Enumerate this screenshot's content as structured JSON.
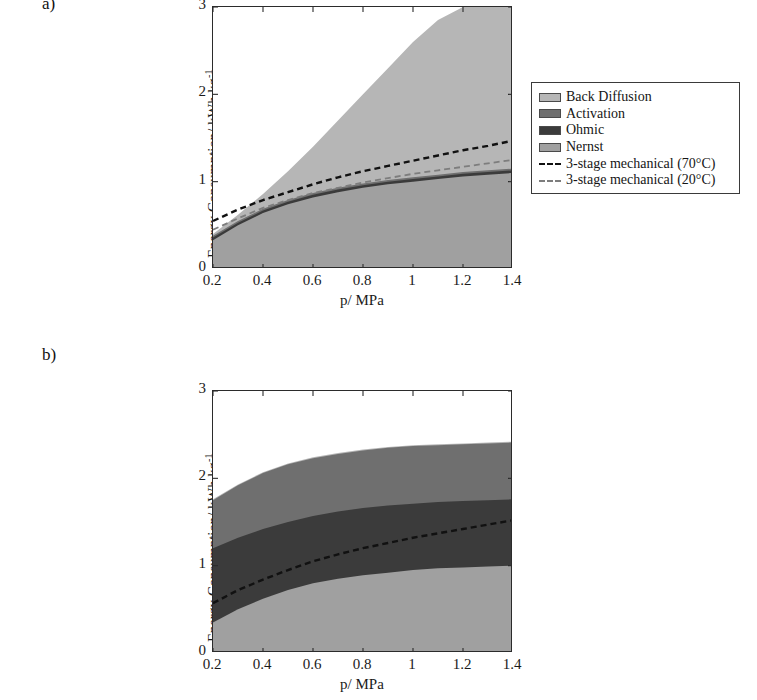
{
  "figure": {
    "panel_a_label": "a)",
    "panel_b_label": "b)"
  },
  "legend": {
    "items": [
      {
        "label": "Back Diffusion",
        "type": "swatch",
        "color": "#b6b6b6"
      },
      {
        "label": "Activation",
        "type": "swatch",
        "color": "#6f6f6f"
      },
      {
        "label": "Ohmic",
        "type": "swatch",
        "color": "#3b3b3b"
      },
      {
        "label": "Nernst",
        "type": "swatch",
        "color": "#a0a0a0"
      },
      {
        "label": "3-stage mechanical (70°C)",
        "type": "dash",
        "color": "#111111"
      },
      {
        "label": "3-stage mechanical (20°C)",
        "type": "dash",
        "color": "#7d7d7d"
      }
    ]
  },
  "chart_data": [
    {
      "id": "panel-a",
      "type": "area",
      "title": "",
      "xlabel": "p/ MPa",
      "ylabel": "Energy Consumption/ kWh kg⁻¹",
      "ylabel_main": "Energy Consumption/ kWh kg",
      "ylabel_sup": "-1",
      "xlim": [
        0.2,
        1.4
      ],
      "ylim": [
        0,
        3
      ],
      "xticks": [
        0.2,
        0.4,
        0.6,
        0.8,
        1,
        1.2,
        1.4
      ],
      "xticklabels": [
        "0.2",
        "0.4",
        "0.6",
        "0.8",
        "1",
        "1.2",
        "1.4"
      ],
      "yticks": [
        0,
        1,
        2,
        3
      ],
      "yticklabels": [
        "0",
        "1",
        "2",
        "3"
      ],
      "grid": false,
      "legend_position": "outside-right",
      "x": [
        0.2,
        0.3,
        0.4,
        0.5,
        0.6,
        0.7,
        0.8,
        0.9,
        1.0,
        1.1,
        1.2,
        1.3,
        1.4
      ],
      "series": [
        {
          "name": "Nernst",
          "color": "#a0a0a0",
          "stack_top": [
            0.33,
            0.5,
            0.64,
            0.74,
            0.82,
            0.88,
            0.93,
            0.97,
            1.0,
            1.03,
            1.06,
            1.08,
            1.1
          ]
        },
        {
          "name": "Ohmic",
          "color": "#3b3b3b",
          "stack_top": [
            0.36,
            0.53,
            0.67,
            0.77,
            0.85,
            0.91,
            0.96,
            1.0,
            1.03,
            1.06,
            1.09,
            1.11,
            1.13
          ]
        },
        {
          "name": "Activation",
          "color": "#6f6f6f",
          "stack_top": [
            0.38,
            0.55,
            0.69,
            0.79,
            0.87,
            0.93,
            0.98,
            1.02,
            1.05,
            1.08,
            1.11,
            1.13,
            1.15
          ]
        },
        {
          "name": "Back Diffusion",
          "color": "#b6b6b6",
          "stack_top": [
            0.4,
            0.62,
            0.86,
            1.12,
            1.4,
            1.7,
            2.0,
            2.3,
            2.6,
            2.85,
            3.0,
            3.0,
            3.0
          ]
        }
      ],
      "lines": [
        {
          "name": "3-stage mechanical (70°C)",
          "color": "#111111",
          "style": "dashed",
          "values": [
            0.55,
            0.68,
            0.79,
            0.88,
            0.97,
            1.05,
            1.12,
            1.18,
            1.24,
            1.3,
            1.36,
            1.41,
            1.47
          ]
        },
        {
          "name": "3-stage mechanical (20°C)",
          "color": "#7d7d7d",
          "style": "dashed",
          "values": [
            0.45,
            0.58,
            0.7,
            0.79,
            0.87,
            0.93,
            0.99,
            1.04,
            1.09,
            1.13,
            1.17,
            1.21,
            1.25
          ]
        }
      ]
    },
    {
      "id": "panel-b",
      "type": "area",
      "title": "",
      "xlabel": "p/ MPa",
      "ylabel": "Energy Consumption/ kWh kg⁻¹",
      "ylabel_main": "Energy Consumption/ kWh kg",
      "ylabel_sup": "-1",
      "xlim": [
        0.2,
        1.4
      ],
      "ylim": [
        0,
        3
      ],
      "xticks": [
        0.2,
        0.4,
        0.6,
        0.8,
        1,
        1.2,
        1.4
      ],
      "xticklabels": [
        "0.2",
        "0.4",
        "0.6",
        "0.8",
        "1",
        "1.2",
        "1.4"
      ],
      "yticks": [
        0,
        1,
        2,
        3
      ],
      "yticklabels": [
        "0",
        "1",
        "2",
        "3"
      ],
      "grid": false,
      "legend_position": "outside-right",
      "x": [
        0.2,
        0.3,
        0.4,
        0.5,
        0.6,
        0.7,
        0.8,
        0.9,
        1.0,
        1.1,
        1.2,
        1.3,
        1.4
      ],
      "series": [
        {
          "name": "Nernst",
          "color": "#a0a0a0",
          "stack_top": [
            0.35,
            0.5,
            0.62,
            0.72,
            0.8,
            0.85,
            0.89,
            0.92,
            0.95,
            0.97,
            0.98,
            0.99,
            1.0
          ]
        },
        {
          "name": "Ohmic",
          "color": "#3b3b3b",
          "stack_top": [
            1.2,
            1.32,
            1.42,
            1.5,
            1.57,
            1.62,
            1.66,
            1.69,
            1.71,
            1.73,
            1.74,
            1.75,
            1.76
          ]
        },
        {
          "name": "Activation",
          "color": "#6f6f6f",
          "stack_top": [
            1.75,
            1.92,
            2.06,
            2.16,
            2.23,
            2.28,
            2.32,
            2.35,
            2.37,
            2.38,
            2.39,
            2.4,
            2.41
          ]
        },
        {
          "name": "Back Diffusion",
          "color": "#b6b6b6",
          "stack_top": [
            1.76,
            1.93,
            2.07,
            2.17,
            2.24,
            2.29,
            2.33,
            2.36,
            2.38,
            2.39,
            2.4,
            2.41,
            2.42
          ]
        }
      ],
      "lines": [
        {
          "name": "3-stage mechanical (70°C)",
          "color": "#111111",
          "style": "dashed",
          "values": [
            0.57,
            0.72,
            0.84,
            0.95,
            1.05,
            1.13,
            1.2,
            1.26,
            1.32,
            1.37,
            1.42,
            1.47,
            1.52
          ]
        }
      ]
    }
  ]
}
